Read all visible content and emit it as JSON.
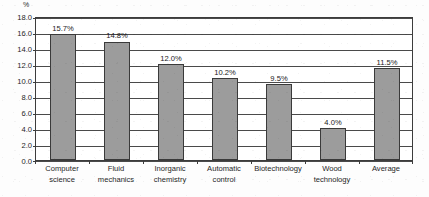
{
  "chart_data": {
    "type": "bar",
    "title": "",
    "xlabel": "",
    "ylabel": "%",
    "unit_label": "%",
    "categories": [
      "Computer science",
      "Fluid mechanics",
      "Inorganic chemistry",
      "Automatic control",
      "Biotechnology",
      "Wood technology",
      "Average"
    ],
    "category_lines": [
      [
        "Computer",
        "science"
      ],
      [
        "Fluid",
        "mechanics"
      ],
      [
        "Inorganic",
        "chemistry"
      ],
      [
        "Automatic",
        "control"
      ],
      [
        "Biotechnology"
      ],
      [
        "Wood",
        "technology"
      ],
      [
        "Average"
      ]
    ],
    "values": [
      15.7,
      14.8,
      12.0,
      10.2,
      9.5,
      4.0,
      11.5
    ],
    "value_labels": [
      "15.7%",
      "14.8%",
      "12.0%",
      "10.2%",
      "9.5%",
      "4.0%",
      "11.5%"
    ],
    "ylim": [
      0.0,
      18.0
    ],
    "ytick_values": [
      0.0,
      2.0,
      4.0,
      6.0,
      8.0,
      10.0,
      12.0,
      14.0,
      16.0,
      18.0
    ],
    "ytick_labels": [
      "0.0",
      "2.0",
      "4.0",
      "6.0",
      "8.0",
      "10.0",
      "12.0",
      "14.0",
      "16.0",
      "18.0"
    ],
    "grid": true,
    "legend": false,
    "legend_position": "none",
    "bar_color": "#9c9c9c",
    "bar_edge_color": "#3a3a3a",
    "grid_color": "#4a4a4a",
    "axis_color": "#3c3c3c",
    "background_color": "#ffffff",
    "text_color": "#1f1f1f"
  }
}
